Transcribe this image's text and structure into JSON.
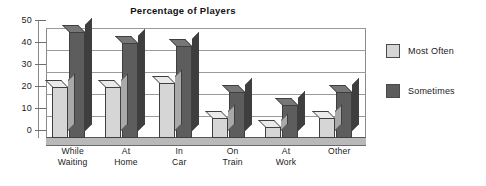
{
  "chart_data": {
    "type": "bar",
    "title": "Percentage of Players",
    "xlabel": "",
    "ylabel": "",
    "ylim": [
      0,
      50
    ],
    "yticks": [
      0,
      10,
      20,
      30,
      40,
      50
    ],
    "grid": true,
    "legend_position": "right",
    "style": "3d-column",
    "categories": [
      "While Waiting",
      "At Home",
      "In Car",
      "On Train",
      "At Work",
      "Other"
    ],
    "category_lines": [
      [
        "While",
        "Waiting"
      ],
      [
        "At",
        "Home"
      ],
      [
        "In",
        "Car"
      ],
      [
        "On",
        "Train"
      ],
      [
        "At",
        "Work"
      ],
      [
        "Other",
        ""
      ]
    ],
    "series": [
      {
        "name": "Most Often",
        "color": "#d6d6d6",
        "values": [
          23,
          23,
          25,
          9,
          5,
          9
        ]
      },
      {
        "name": "Sometimes",
        "color": "#5d5d5d",
        "values": [
          48,
          43,
          42,
          21,
          15,
          21
        ]
      }
    ]
  },
  "legend": {
    "items": [
      {
        "label": "Most Often"
      },
      {
        "label": "Sometimes"
      }
    ]
  }
}
